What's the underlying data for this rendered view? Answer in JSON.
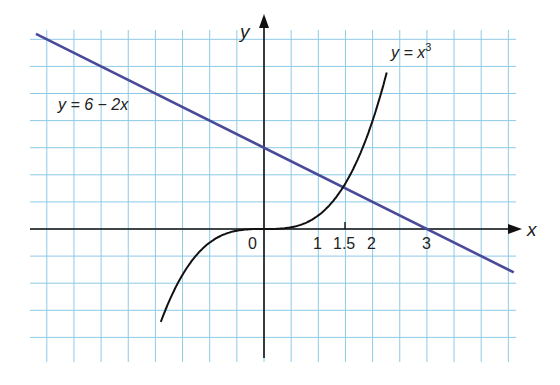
{
  "chart_data": {
    "type": "line",
    "title": "",
    "xlabel": "x",
    "ylabel": "y",
    "x_tick_labels": [
      "0",
      "1",
      "1.5",
      "2",
      "3"
    ],
    "x_tick_values": [
      0,
      1,
      1.5,
      2,
      3
    ],
    "xlim": [
      -4.1,
      4.6
    ],
    "ylim": [
      -10,
      6.7
    ],
    "grid": true,
    "series": [
      {
        "name": "y = 6 − 2x",
        "label_main": "y = 6 − 2x",
        "color": "#4a4a9a",
        "x": [
          -4.2,
          4.6
        ],
        "y": [
          14.4,
          -3.2
        ]
      },
      {
        "name": "y = x³",
        "label_base": "y = x",
        "label_sup": "3",
        "color": "#111111",
        "x": [
          -1.9,
          -1.5,
          -1,
          -0.5,
          0,
          0.5,
          1,
          1.5,
          2,
          2.25
        ],
        "y": [
          -6.859,
          -3.375,
          -1,
          -0.125,
          0,
          0.125,
          1,
          3.375,
          8,
          11.39
        ]
      }
    ],
    "intersection": {
      "x": 1.5,
      "y": 3
    }
  },
  "colors": {
    "grid": "#8ecae6",
    "axis": "#111111",
    "line": "#4a4a9a",
    "curve": "#111111"
  }
}
